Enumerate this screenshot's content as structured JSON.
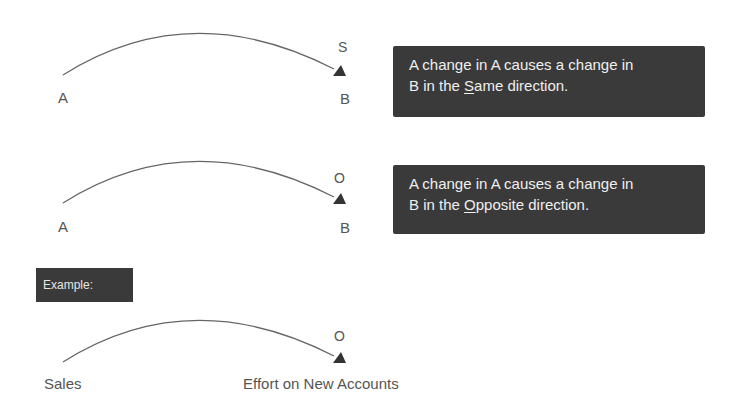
{
  "diagrams": [
    {
      "from": "A",
      "to": "B",
      "polarity": "S",
      "description": {
        "line1": "A change   in A causes a change in",
        "line2_prefix": "B in the ",
        "line2_key": "S",
        "line2_rest": "ame direction."
      }
    },
    {
      "from": "A",
      "to": "B",
      "polarity": "O",
      "description": {
        "line1": "A change in A causes a change in",
        "line2_prefix": "B in the ",
        "line2_key": "O",
        "line2_rest": "pposite direction."
      }
    }
  ],
  "example": {
    "label": "Example:",
    "from": "Sales",
    "to": "Effort on New Accounts",
    "polarity": "O"
  },
  "colors": {
    "box_background": "#3a3a3a",
    "box_text": "#efefef",
    "arrow": "#444444"
  }
}
